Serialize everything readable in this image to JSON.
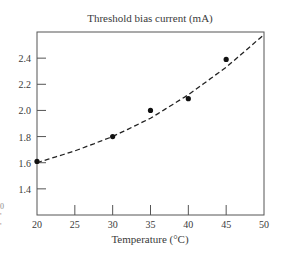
{
  "chart_data": {
    "type": "scatter",
    "title": "Threshold bias current (mA)",
    "xlabel": "Temperature (°C)",
    "ylabel": "",
    "xlim": [
      20,
      50
    ],
    "ylim": [
      1.2,
      2.6
    ],
    "x_ticks": [
      20,
      25,
      30,
      35,
      40,
      45,
      50
    ],
    "x_tick_labels": [
      "20",
      "25",
      "30",
      "35",
      "40",
      "45",
      "50"
    ],
    "y_ticks": [
      1.4,
      1.6,
      1.8,
      2.0,
      2.2,
      2.4
    ],
    "y_tick_labels": [
      "1.4",
      "1.6",
      "1.8",
      "2.0",
      "2.2",
      "2.4"
    ],
    "grid": false,
    "legend": null,
    "series": [
      {
        "name": "Measured",
        "style": "markers",
        "x": [
          20,
          30,
          35,
          40,
          45
        ],
        "y": [
          1.61,
          1.8,
          2.0,
          2.09,
          2.39
        ]
      },
      {
        "name": "Fit",
        "style": "dashed-line",
        "x": [
          20,
          25,
          30,
          35,
          40,
          45,
          50
        ],
        "y": [
          1.6,
          1.69,
          1.8,
          1.94,
          2.12,
          2.33,
          2.58
        ]
      }
    ]
  },
  "left_edge_marks": [
    "0",
    "'",
    "'"
  ]
}
